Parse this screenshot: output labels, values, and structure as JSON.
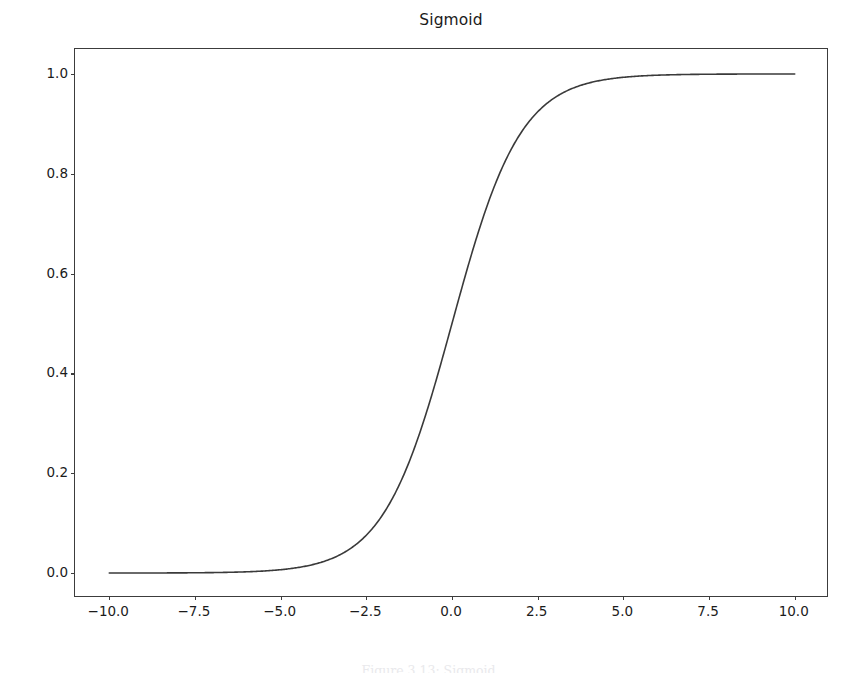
{
  "chart_data": {
    "type": "line",
    "title": "Sigmoid",
    "xlabel": "",
    "ylabel": "",
    "xlim": [
      -11.0,
      11.0
    ],
    "ylim": [
      -0.05,
      1.05
    ],
    "grid": false,
    "legend": null,
    "line_color": "#3a3a3a",
    "line_width": 1.6,
    "x_ticks": [
      "−10.0",
      "−7.5",
      "−5.0",
      "−2.5",
      "0.0",
      "2.5",
      "5.0",
      "7.5",
      "10.0"
    ],
    "x_tick_values": [
      -10.0,
      -7.5,
      -5.0,
      -2.5,
      0.0,
      2.5,
      5.0,
      7.5,
      10.0
    ],
    "y_ticks": [
      "0.0",
      "0.2",
      "0.4",
      "0.6",
      "0.8",
      "1.0"
    ],
    "y_tick_values": [
      0.0,
      0.2,
      0.4,
      0.6,
      0.8,
      1.0
    ],
    "function": "sigmoid(x) = 1 / (1 + exp(-x))",
    "series": [
      {
        "name": "sigmoid",
        "x": [
          -10.0,
          -9.5,
          -9.0,
          -8.5,
          -8.0,
          -7.5,
          -7.0,
          -6.5,
          -6.0,
          -5.5,
          -5.0,
          -4.5,
          -4.0,
          -3.5,
          -3.0,
          -2.5,
          -2.0,
          -1.5,
          -1.0,
          -0.5,
          0.0,
          0.5,
          1.0,
          1.5,
          2.0,
          2.5,
          3.0,
          3.5,
          4.0,
          4.5,
          5.0,
          5.5,
          6.0,
          6.5,
          7.0,
          7.5,
          8.0,
          8.5,
          9.0,
          9.5,
          10.0
        ],
        "y": [
          4.54e-05,
          7.49e-05,
          0.0001234,
          0.0002034,
          0.0003354,
          0.0005527,
          0.0009111,
          0.0015012,
          0.0024726,
          0.0040702,
          0.0066929,
          0.0109869,
          0.0179862,
          0.0293122,
          0.0474259,
          0.0758582,
          0.1192029,
          0.1824255,
          0.2689414,
          0.3775407,
          0.5,
          0.6224593,
          0.7310586,
          0.8175745,
          0.8807971,
          0.9241418,
          0.9525741,
          0.9706878,
          0.9820138,
          0.9890131,
          0.9933071,
          0.9959298,
          0.9975274,
          0.9984988,
          0.9990889,
          0.9994473,
          0.9996646,
          0.9997966,
          0.9998766,
          0.9999251,
          0.9999546
        ]
      }
    ]
  },
  "caption": {
    "text": "Figure 3.13: Sigmoid"
  }
}
